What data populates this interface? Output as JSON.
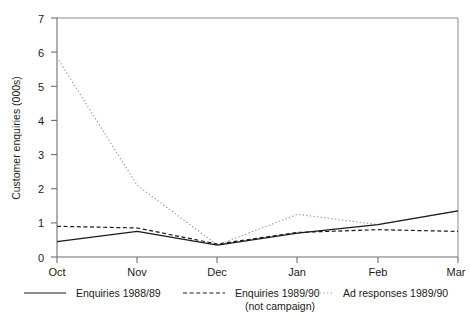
{
  "chart_data": {
    "type": "line",
    "title": "",
    "xlabel": "",
    "ylabel": "Customer enquiries (000s)",
    "categories": [
      "Oct",
      "Nov",
      "Dec",
      "Jan",
      "Feb",
      "Mar"
    ],
    "ylim": [
      0,
      7
    ],
    "yticks": [
      0,
      1,
      2,
      3,
      4,
      5,
      6,
      7
    ],
    "ytick_labels": [
      "0",
      "1",
      "2",
      "3",
      "4",
      "5",
      "6",
      "7"
    ],
    "grid": false,
    "legend_position": "below",
    "series": [
      {
        "name": "Enquiries 1988/89",
        "style": "solid",
        "color": "#1a1a1a",
        "values": [
          0.45,
          0.75,
          0.35,
          0.7,
          0.95,
          1.35
        ]
      },
      {
        "name": "Enquiries 1989/90 (not campaign)",
        "style": "dashed",
        "color": "#1a1a1a",
        "values": [
          0.9,
          0.85,
          0.38,
          0.72,
          0.8,
          0.75
        ]
      },
      {
        "name": "Ad responses 1989/90",
        "style": "dotted",
        "color": "#999999",
        "values": [
          5.85,
          2.1,
          0.35,
          1.25,
          0.95,
          1.35
        ]
      }
    ]
  },
  "axes": {
    "y_title": "Customer enquiries (000s)",
    "y_labels": [
      "7",
      "6",
      "5",
      "4",
      "3",
      "2",
      "1",
      "0"
    ],
    "x_labels": [
      "Oct",
      "Nov",
      "Dec",
      "Jan",
      "Feb",
      "Mar"
    ]
  },
  "legend": {
    "items": [
      {
        "label": "Enquiries 1988/89",
        "label2": "",
        "style": "solid"
      },
      {
        "label": "Enquiries 1989/90",
        "label2": "(not campaign)",
        "style": "dashed"
      },
      {
        "label": "Ad responses 1989/90",
        "label2": "",
        "style": "dotted"
      }
    ]
  },
  "colors": {
    "axis": "#6e6e6e",
    "solid_series": "#1a1a1a",
    "dashed_series": "#1a1a1a",
    "dotted_series": "#a8a8a8",
    "text": "#1a1a1a",
    "background": "#ffffff"
  }
}
